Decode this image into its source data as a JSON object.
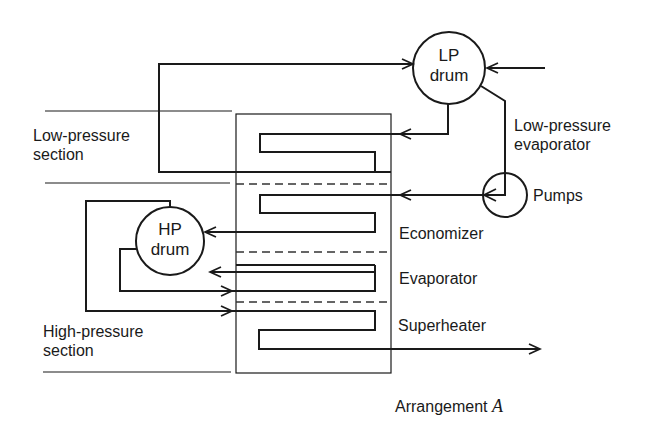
{
  "diagram": {
    "title": "Arrangement A",
    "caption_prefix": "Arrangement",
    "caption_variable": "A",
    "sections": {
      "low_pressure": {
        "line1": "Low-pressure",
        "line2": "section"
      },
      "high_pressure": {
        "line1": "High-pressure",
        "line2": "section"
      }
    },
    "nodes": {
      "lp_drum": {
        "line1": "LP",
        "line2": "drum"
      },
      "hp_drum": {
        "line1": "HP",
        "line2": "drum"
      },
      "pumps": "Pumps"
    },
    "labels": {
      "lp_evaporator": {
        "line1": "Low-pressure",
        "line2": "evaporator"
      },
      "economizer": "Economizer",
      "evaporator": "Evaporator",
      "superheater": "Superheater"
    },
    "flows": [
      {
        "from": "feed-inlet",
        "to": "lp_drum"
      },
      {
        "from": "lp-loop",
        "to": "lp_drum"
      },
      {
        "from": "lp_drum",
        "to": "low-pressure-evaporator-coil"
      },
      {
        "from": "lp_drum",
        "to": "pumps"
      },
      {
        "from": "pumps",
        "to": "economizer-coil"
      },
      {
        "from": "economizer-coil",
        "to": "hp_drum"
      },
      {
        "from": "evaporator-coil",
        "to": "hp_drum"
      },
      {
        "from": "hp_drum",
        "to": "evaporator-coil"
      },
      {
        "from": "hp_drum",
        "to": "superheater-coil"
      },
      {
        "from": "superheater-coil",
        "to": "outlet"
      }
    ]
  }
}
